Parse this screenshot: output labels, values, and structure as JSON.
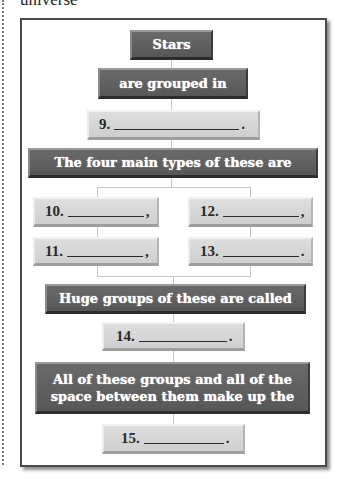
{
  "header": {
    "partial_word": "universe"
  },
  "colors": {
    "dark_box": "#5f5f5f",
    "light_box": "#d6d6d6",
    "connector": "#c8c8c8",
    "frame_border": "#4a4a4a"
  },
  "diagram": {
    "nodes": [
      {
        "id": "stars",
        "type": "dark",
        "text": "Stars"
      },
      {
        "id": "grouped",
        "type": "dark",
        "text": "are grouped in"
      },
      {
        "id": "q9",
        "type": "blank",
        "number": "9.",
        "punct": "."
      },
      {
        "id": "types",
        "type": "dark",
        "text": "The four main types of these are"
      },
      {
        "id": "q10",
        "type": "blank",
        "number": "10.",
        "punct": ","
      },
      {
        "id": "q11",
        "type": "blank",
        "number": "11.",
        "punct": ","
      },
      {
        "id": "q12",
        "type": "blank",
        "number": "12.",
        "punct": ","
      },
      {
        "id": "q13",
        "type": "blank",
        "number": "13.",
        "punct": "."
      },
      {
        "id": "huge",
        "type": "dark",
        "text": "Huge groups of these are called"
      },
      {
        "id": "q14",
        "type": "blank",
        "number": "14.",
        "punct": "."
      },
      {
        "id": "all",
        "type": "dark",
        "text": "All of these groups and all of the space between them make up the"
      },
      {
        "id": "q15",
        "type": "blank",
        "number": "15.",
        "punct": "."
      }
    ]
  }
}
